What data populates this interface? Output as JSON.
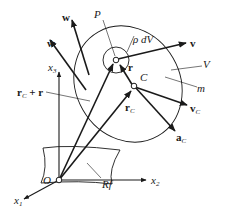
{
  "diagram": {
    "labels": {
      "w": "w",
      "w_dot": "ẇ",
      "P": "P",
      "rho_dV": "ρ dV",
      "v": "v",
      "r": "r",
      "C": "C",
      "V": "V",
      "m": "m",
      "x3": "x",
      "x3_sub": "3",
      "rC_plus_r": "r",
      "rC_plus_r_sub": "C",
      "rC_plus_r_tail": " + r",
      "rC": "r",
      "rC_sub": "C",
      "vC": "v",
      "vC_sub": "C",
      "aC": "a",
      "aC_sub": "C",
      "O": "O",
      "x2": "x",
      "x2_sub": "2",
      "x1": "x",
      "x1_sub": "1",
      "Rf": "Rf"
    },
    "colors": {
      "stroke": "#1a1a1a",
      "background": "#ffffff"
    }
  }
}
